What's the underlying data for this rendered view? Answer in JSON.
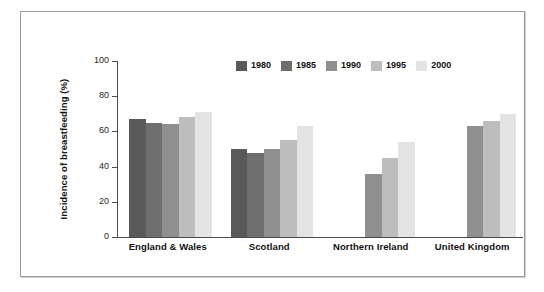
{
  "chart_data": {
    "type": "bar",
    "title": "",
    "xlabel": "",
    "ylabel": "Incidence of breastfeeding (%)",
    "ylim": [
      0,
      100
    ],
    "yticks": [
      0,
      20,
      40,
      60,
      80,
      100
    ],
    "ytick_labels": [
      "0",
      "20",
      "40",
      "60",
      "80",
      "100"
    ],
    "grid": false,
    "legend_position": "top-center",
    "categories": [
      "England & Wales",
      "Scotland",
      "Northern Ireland",
      "United Kingdom"
    ],
    "series": [
      {
        "name": "1980",
        "color": "#595959",
        "values": [
          67,
          50,
          null,
          null
        ]
      },
      {
        "name": "1985",
        "color": "#6e6e6e",
        "values": [
          65,
          48,
          null,
          null
        ]
      },
      {
        "name": "1990",
        "color": "#8f8f8f",
        "values": [
          64,
          50,
          36,
          63
        ]
      },
      {
        "name": "1995",
        "color": "#bdbdbd",
        "values": [
          68,
          55,
          45,
          66
        ]
      },
      {
        "name": "2000",
        "color": "#e3e3e3",
        "values": [
          71,
          63,
          54,
          70
        ]
      }
    ]
  },
  "figure": {
    "frame_color": "#9a9a9a",
    "background": "#ffffff",
    "axis_color": "#4a4a4a"
  }
}
